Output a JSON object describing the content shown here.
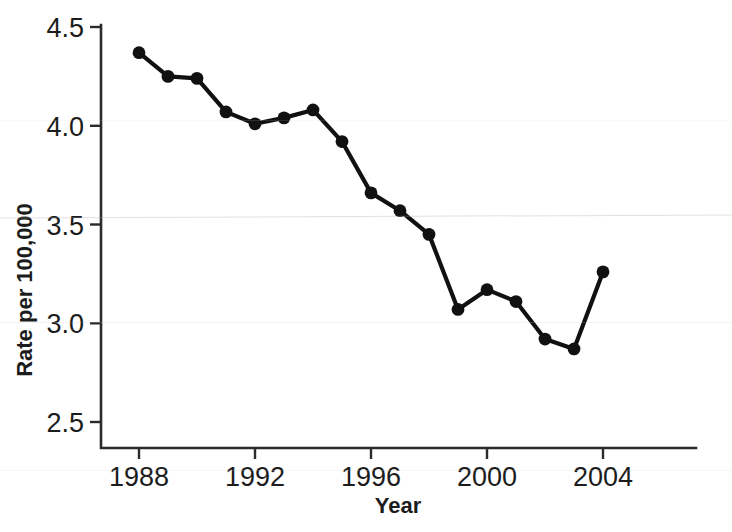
{
  "chart_data": {
    "type": "line",
    "title": "",
    "xlabel": "Year",
    "ylabel": "Rate per 100,000",
    "x": [
      1988,
      1989,
      1990,
      1991,
      1992,
      1993,
      1994,
      1995,
      1996,
      1997,
      1998,
      1999,
      2000,
      2001,
      2002,
      2003,
      2004
    ],
    "values": [
      4.37,
      4.25,
      4.24,
      4.07,
      4.01,
      4.04,
      4.08,
      3.92,
      3.66,
      3.57,
      3.45,
      3.07,
      3.17,
      3.11,
      2.92,
      2.87,
      3.26
    ],
    "series": [
      {
        "name": "Rate",
        "values": [
          4.37,
          4.25,
          4.24,
          4.07,
          4.01,
          4.04,
          4.08,
          3.92,
          3.66,
          3.57,
          3.45,
          3.07,
          3.17,
          3.11,
          2.92,
          2.87,
          3.26
        ]
      }
    ],
    "xlim": [
      1987.5,
      2004.5
    ],
    "ylim": [
      2.35,
      4.55
    ],
    "xticks": [
      1988,
      1992,
      1996,
      2000,
      2004
    ],
    "xticklabels": [
      "1988",
      "1992",
      "1996",
      "2000",
      "2004"
    ],
    "yticks": [
      2.5,
      3.0,
      3.5,
      4.0,
      4.5
    ],
    "yticklabels": [
      "2.5",
      "3.0",
      "3.5",
      "4.0",
      "4.5"
    ],
    "grid": false,
    "legend": null,
    "marker": "filled-circle",
    "line_color": "#111111",
    "marker_color": "#111111",
    "axis_color": "#2b2b2b",
    "background": "#ffffff"
  },
  "axes": {
    "y_title": "Rate per 100,000",
    "x_title": "Year",
    "y_tick_labels": [
      "4.5",
      "4.0",
      "3.5",
      "3.0",
      "2.5"
    ],
    "x_tick_labels": [
      "1988",
      "1992",
      "1996",
      "2000",
      "2004"
    ]
  }
}
